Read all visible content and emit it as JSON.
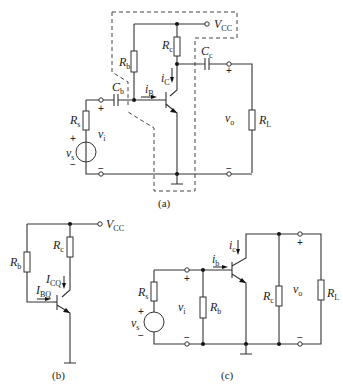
{
  "figure": {
    "subfigures": [
      {
        "id": "a",
        "caption": "(a)",
        "labels": {
          "vcc": "V",
          "vcc_sub": "CC",
          "rb": "R",
          "rb_sub": "b",
          "rc": "R",
          "rc_sub": "c",
          "cb": "C",
          "cb_sub": "b",
          "ce": "C",
          "ce_sub": "c",
          "ib": "i",
          "ib_sub": "B",
          "ic": "i",
          "ic_sub": "C",
          "rs": "R",
          "rs_sub": "s",
          "vs": "v",
          "vs_sub": "s",
          "vi": "v",
          "vi_sub": "i",
          "vo": "v",
          "vo_sub": "o",
          "rl": "R",
          "rl_sub": "L",
          "plus": "+",
          "minus": "−"
        }
      },
      {
        "id": "b",
        "caption": "(b)",
        "labels": {
          "vcc": "V",
          "vcc_sub": "CC",
          "rb": "R",
          "rb_sub": "b",
          "rc": "R",
          "rc_sub": "c",
          "icq": "I",
          "icq_sub": "CQ",
          "ibq": "I",
          "ibq_sub": "BQ"
        }
      },
      {
        "id": "c",
        "caption": "(c)",
        "labels": {
          "ib": "i",
          "ib_sub": "b",
          "ic": "i",
          "ic_sub": "c",
          "rs": "R",
          "rs_sub": "s",
          "vs": "v",
          "vs_sub": "s",
          "vi": "v",
          "vi_sub": "i",
          "rb": "R",
          "rb_sub": "b",
          "rc": "R",
          "rc_sub": "c",
          "vo": "v",
          "vo_sub": "o",
          "rl": "R",
          "rl_sub": "L",
          "plus": "+",
          "minus": "−"
        }
      }
    ]
  }
}
